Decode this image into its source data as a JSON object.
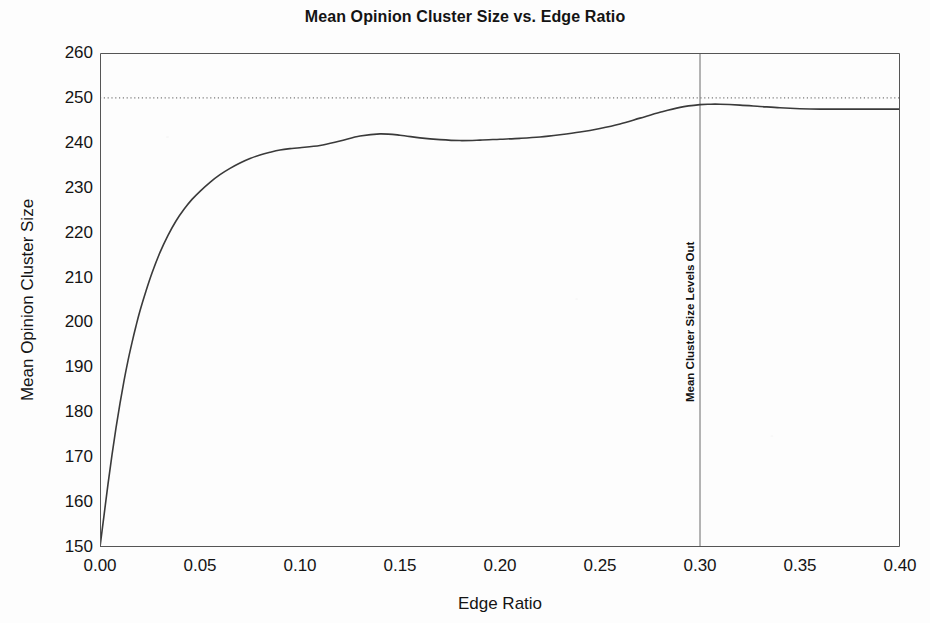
{
  "chart_data": {
    "type": "line",
    "title": "Mean Opinion Cluster Size vs. Edge Ratio",
    "xlabel": "Edge Ratio",
    "ylabel": "Mean Opinion Cluster Size",
    "xlim": [
      0.0,
      0.4
    ],
    "ylim": [
      150,
      260
    ],
    "grid": false,
    "legend": null,
    "x_ticks": [
      "0.00",
      "0.05",
      "0.10",
      "0.15",
      "0.20",
      "0.25",
      "0.30",
      "0.35",
      "0.40"
    ],
    "x_tick_values": [
      0.0,
      0.05,
      0.1,
      0.15,
      0.2,
      0.25,
      0.3,
      0.35,
      0.4
    ],
    "y_ticks": [
      "150",
      "160",
      "170",
      "180",
      "190",
      "200",
      "210",
      "220",
      "230",
      "240",
      "250",
      "260"
    ],
    "y_tick_values": [
      150,
      160,
      170,
      180,
      190,
      200,
      210,
      220,
      230,
      240,
      250,
      260
    ],
    "series": [
      {
        "name": "Mean Opinion Cluster Size",
        "color": "#3a3a3a",
        "x": [
          0.0,
          0.002,
          0.004,
          0.006,
          0.008,
          0.01,
          0.012,
          0.014,
          0.016,
          0.018,
          0.02,
          0.023,
          0.026,
          0.03,
          0.034,
          0.038,
          0.042,
          0.046,
          0.05,
          0.055,
          0.06,
          0.065,
          0.07,
          0.075,
          0.08,
          0.085,
          0.09,
          0.095,
          0.1,
          0.11,
          0.12,
          0.13,
          0.14,
          0.15,
          0.16,
          0.17,
          0.18,
          0.19,
          0.2,
          0.21,
          0.22,
          0.23,
          0.24,
          0.25,
          0.26,
          0.27,
          0.28,
          0.29,
          0.3,
          0.305,
          0.31,
          0.32,
          0.33,
          0.34,
          0.35,
          0.36,
          0.37,
          0.38,
          0.39,
          0.4
        ],
        "y": [
          150.0,
          157.0,
          164.0,
          170.5,
          176.5,
          182.0,
          187.0,
          191.5,
          195.5,
          199.2,
          202.6,
          207.0,
          211.0,
          215.6,
          219.4,
          222.6,
          225.2,
          227.4,
          229.2,
          231.2,
          232.9,
          234.3,
          235.5,
          236.5,
          237.3,
          237.9,
          238.4,
          238.7,
          238.9,
          239.4,
          240.4,
          241.5,
          242.0,
          241.7,
          241.1,
          240.7,
          240.5,
          240.6,
          240.8,
          241.0,
          241.3,
          241.8,
          242.4,
          243.2,
          244.2,
          245.5,
          246.8,
          247.9,
          248.5,
          248.6,
          248.6,
          248.4,
          248.1,
          247.8,
          247.6,
          247.5,
          247.5,
          247.5,
          247.5,
          247.5
        ]
      }
    ],
    "reference_lines": [
      {
        "name": "upper-asymptote",
        "orientation": "horizontal",
        "value": 250,
        "style": "dotted",
        "color": "#5a5a5a",
        "label": ""
      },
      {
        "name": "levels-out-marker",
        "orientation": "vertical",
        "value": 0.3,
        "style": "solid",
        "color": "#6a6a6a",
        "label": "Mean Cluster Size Levels Out"
      }
    ],
    "annotations": [
      {
        "text": "Mean Cluster Size Levels Out",
        "x": 0.3,
        "y": 185,
        "rotation": -90
      }
    ]
  }
}
